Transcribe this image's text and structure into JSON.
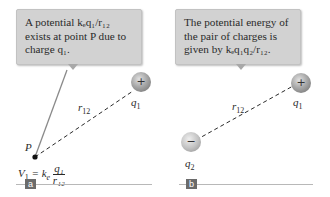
{
  "panel_a": {
    "tag": "a",
    "callout": {
      "line1": "A potential kₑq₁/r₁₂",
      "line2": "exists at point P due to",
      "line3": "charge q₁."
    },
    "distance_label": "r",
    "distance_sub": "12",
    "charge_label": "q",
    "charge_sub": "1",
    "charge_sign": "+",
    "point_label": "P",
    "formula": {
      "lhs": "V",
      "lhs_sub": "1",
      "eq": " = k",
      "k_sub": "e",
      "num": "q₁",
      "den": "r₁₂"
    }
  },
  "panel_b": {
    "tag": "b",
    "callout": {
      "line1": "The potential energy of",
      "line2": "the pair of charges is",
      "line3": "given by kₑq₁q₂/r₁₂."
    },
    "distance_label": "r",
    "distance_sub": "12",
    "charge1_label": "q",
    "charge1_sub": "1",
    "charge1_sign": "+",
    "charge2_label": "q",
    "charge2_sub": "2",
    "charge2_sign": "−"
  },
  "colors": {
    "callout_bg": "#d2d2d2",
    "line": "#8a8a8a",
    "tag_bg": "#6b6b6b"
  }
}
